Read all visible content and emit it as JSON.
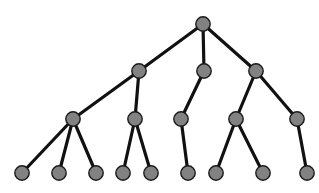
{
  "diagram": {
    "type": "tree",
    "node_color": "#828282",
    "node_stroke": "#1a1a1a",
    "edge_color": "#111111",
    "edge_width": 3.2,
    "node_radius": 7.2,
    "nodes": [
      {
        "id": "n0",
        "x": 203,
        "y": 24
      },
      {
        "id": "n1",
        "x": 139,
        "y": 71
      },
      {
        "id": "n2",
        "x": 204,
        "y": 71
      },
      {
        "id": "n3",
        "x": 256,
        "y": 71
      },
      {
        "id": "n4",
        "x": 73,
        "y": 119
      },
      {
        "id": "n5",
        "x": 135,
        "y": 119
      },
      {
        "id": "n6",
        "x": 181,
        "y": 119
      },
      {
        "id": "n7",
        "x": 236,
        "y": 119
      },
      {
        "id": "n8",
        "x": 297,
        "y": 119
      },
      {
        "id": "n9",
        "x": 22,
        "y": 173
      },
      {
        "id": "n10",
        "x": 59,
        "y": 173
      },
      {
        "id": "n11",
        "x": 96,
        "y": 173
      },
      {
        "id": "n12",
        "x": 123,
        "y": 173
      },
      {
        "id": "n13",
        "x": 151,
        "y": 173
      },
      {
        "id": "n14",
        "x": 188,
        "y": 173
      },
      {
        "id": "n15",
        "x": 216,
        "y": 173
      },
      {
        "id": "n16",
        "x": 263,
        "y": 173
      },
      {
        "id": "n17",
        "x": 307,
        "y": 173
      }
    ],
    "edges": [
      [
        "n0",
        "n1"
      ],
      [
        "n0",
        "n2"
      ],
      [
        "n0",
        "n3"
      ],
      [
        "n1",
        "n4"
      ],
      [
        "n1",
        "n5"
      ],
      [
        "n2",
        "n6"
      ],
      [
        "n3",
        "n7"
      ],
      [
        "n3",
        "n8"
      ],
      [
        "n4",
        "n9"
      ],
      [
        "n4",
        "n10"
      ],
      [
        "n4",
        "n11"
      ],
      [
        "n5",
        "n12"
      ],
      [
        "n5",
        "n13"
      ],
      [
        "n6",
        "n14"
      ],
      [
        "n7",
        "n15"
      ],
      [
        "n7",
        "n16"
      ],
      [
        "n8",
        "n17"
      ]
    ]
  }
}
